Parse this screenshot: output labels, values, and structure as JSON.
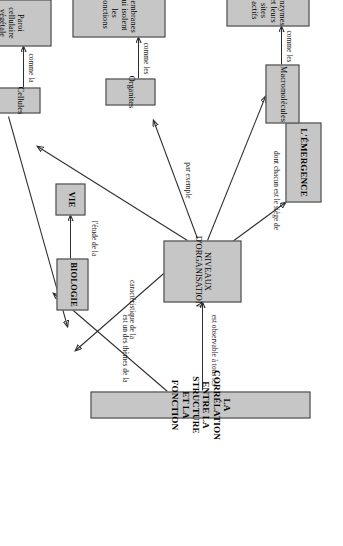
{
  "diagram": {
    "title": "LA CORRÉLATION ENTRE LA STRUCTURE ET LA FONCTION",
    "language": "fr",
    "orientation": "rotated-90-ccw",
    "background_color": "#ffffff",
    "node_fill_color": "#c6c6c6",
    "node_border_color": "#3a3a3a",
    "line_color": "#2e2e2e"
  },
  "nodes": {
    "correlation": "LA CORRÉLATION ENTRE LA STRUCTURE ET LA FONCTION",
    "niveaux": "NIVEAUX D'ORGANISATION",
    "emergence": "L'ÉMERGENCE",
    "macromolecules": "Macromolécules",
    "enzymes": "Enzymes et leurs sites actifs",
    "organites": "Organites",
    "membranes": "Membranes qui isolent les fonctions",
    "cellules": "Cellules",
    "paroi": "Paroi cellulaire végétale qui soutient",
    "vie": "VIE",
    "biologie": "BIOLOGIE"
  },
  "link_labels": {
    "est_observable": "est observable à tous les",
    "est_un_des_themes": "est un des thèmes de la",
    "dont_chacun": "dont chacun est le siège de",
    "par_exemple": "par exemple",
    "comme_les_1": "comme les",
    "comme_les_2": "comme les",
    "comme_la": "comme la",
    "caracteristique": "caractéristique de la",
    "niveau_auquel": "niveau auquel émergent les propriétés de la",
    "letude_de_la": "l'étude de la"
  },
  "edges": [
    {
      "from": "correlation",
      "to": "niveaux",
      "label": "est observable à tous les"
    },
    {
      "from": "correlation",
      "to": "biologie",
      "label": "est un des thèmes de la"
    },
    {
      "from": "niveaux",
      "to": "emergence",
      "label": "dont chacun est le siège de"
    },
    {
      "from": "niveaux",
      "to": "macromolecules",
      "label": "par exemple"
    },
    {
      "from": "niveaux",
      "to": "organites",
      "label": "par exemple"
    },
    {
      "from": "niveaux",
      "to": "cellules",
      "label": "par exemple"
    },
    {
      "from": "niveaux",
      "to": "vie",
      "label": "caractéristique de la"
    },
    {
      "from": "macromolecules",
      "to": "enzymes",
      "label": "comme les"
    },
    {
      "from": "organites",
      "to": "membranes",
      "label": "comme les"
    },
    {
      "from": "cellules",
      "to": "paroi",
      "label": "comme la"
    },
    {
      "from": "cellules",
      "to": "vie",
      "label": "niveau auquel émergent les propriétés de la"
    },
    {
      "from": "biologie",
      "to": "vie",
      "label": "l'étude de la"
    }
  ]
}
